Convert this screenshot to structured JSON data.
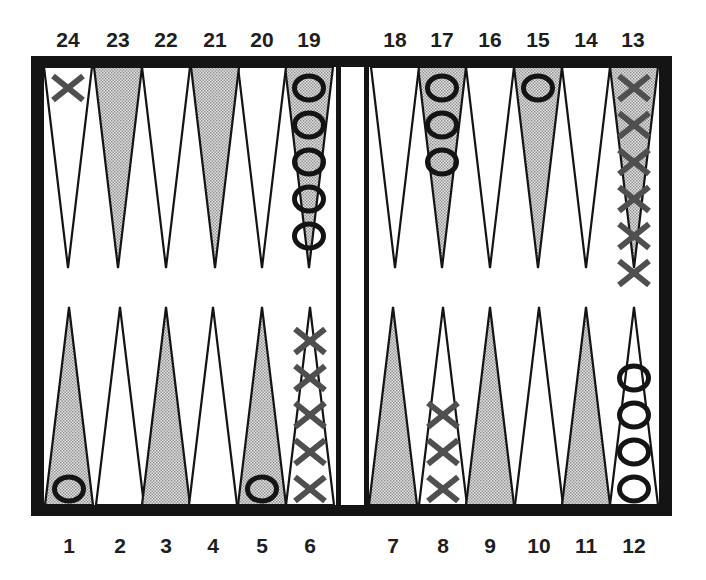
{
  "board": {
    "frame_color": "#141414",
    "stipple_color": "#c4c4c4",
    "x_color": "#4f4f4f",
    "o_color": "#141414"
  },
  "labels": {
    "top": [
      "24",
      "23",
      "22",
      "21",
      "20",
      "19",
      "18",
      "17",
      "16",
      "15",
      "14",
      "13"
    ],
    "bottom": [
      "1",
      "2",
      "3",
      "4",
      "5",
      "6",
      "7",
      "8",
      "9",
      "10",
      "11",
      "12"
    ]
  },
  "points": [
    {
      "number": 1,
      "shaded": true,
      "checkers": {
        "player": "O",
        "count": 1
      }
    },
    {
      "number": 2,
      "shaded": false,
      "checkers": {
        "player": null,
        "count": 0
      }
    },
    {
      "number": 3,
      "shaded": true,
      "checkers": {
        "player": null,
        "count": 0
      }
    },
    {
      "number": 4,
      "shaded": false,
      "checkers": {
        "player": null,
        "count": 0
      }
    },
    {
      "number": 5,
      "shaded": true,
      "checkers": {
        "player": "O",
        "count": 1
      }
    },
    {
      "number": 6,
      "shaded": false,
      "checkers": {
        "player": "X",
        "count": 5
      }
    },
    {
      "number": 7,
      "shaded": true,
      "checkers": {
        "player": null,
        "count": 0
      }
    },
    {
      "number": 8,
      "shaded": false,
      "checkers": {
        "player": "X",
        "count": 3
      }
    },
    {
      "number": 9,
      "shaded": true,
      "checkers": {
        "player": null,
        "count": 0
      }
    },
    {
      "number": 10,
      "shaded": false,
      "checkers": {
        "player": null,
        "count": 0
      }
    },
    {
      "number": 11,
      "shaded": true,
      "checkers": {
        "player": null,
        "count": 0
      }
    },
    {
      "number": 12,
      "shaded": false,
      "checkers": {
        "player": "O",
        "count": 4
      }
    },
    {
      "number": 13,
      "shaded": true,
      "checkers": {
        "player": "X",
        "count": 6
      }
    },
    {
      "number": 14,
      "shaded": false,
      "checkers": {
        "player": null,
        "count": 0
      }
    },
    {
      "number": 15,
      "shaded": true,
      "checkers": {
        "player": "O",
        "count": 1
      }
    },
    {
      "number": 16,
      "shaded": false,
      "checkers": {
        "player": null,
        "count": 0
      }
    },
    {
      "number": 17,
      "shaded": true,
      "checkers": {
        "player": "O",
        "count": 3
      }
    },
    {
      "number": 18,
      "shaded": false,
      "checkers": {
        "player": null,
        "count": 0
      }
    },
    {
      "number": 19,
      "shaded": true,
      "checkers": {
        "player": "O",
        "count": 5
      }
    },
    {
      "number": 20,
      "shaded": false,
      "checkers": {
        "player": null,
        "count": 0
      }
    },
    {
      "number": 21,
      "shaded": true,
      "checkers": {
        "player": null,
        "count": 0
      }
    },
    {
      "number": 22,
      "shaded": false,
      "checkers": {
        "player": null,
        "count": 0
      }
    },
    {
      "number": 23,
      "shaded": true,
      "checkers": {
        "player": null,
        "count": 0
      }
    },
    {
      "number": 24,
      "shaded": false,
      "checkers": {
        "player": "X",
        "count": 1
      }
    }
  ]
}
